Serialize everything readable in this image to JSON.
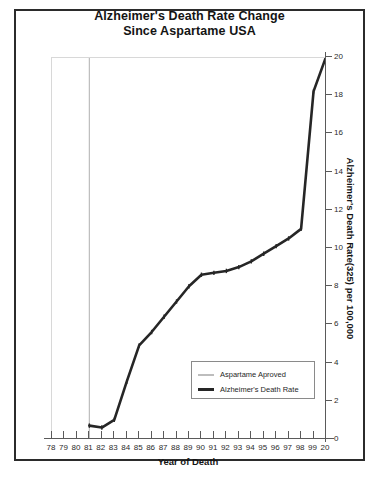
{
  "chart_data": {
    "type": "line",
    "title": "Alzheimer's Death Rate Change Since Aspartame USA",
    "title_line1": "Alzheimer's Death Rate Change",
    "title_line2": "Since Aspartame USA",
    "xlabel": "Year of Death",
    "ylabel": "Alzheimer's Death Rate(325) per 100,000",
    "ylabel_main": "Alzheimer's Death Rate",
    "ylabel_sub": "(325)",
    "ylabel_tail": " per 100,000",
    "xlim": [
      78,
      100
    ],
    "ylim": [
      0,
      20
    ],
    "yticks": [
      0,
      2,
      4,
      6,
      8,
      10,
      12,
      14,
      16,
      18,
      20
    ],
    "ytick_labels": [
      "0",
      "2",
      "4",
      "6",
      "8",
      "10",
      "12",
      "14",
      "16",
      "18",
      "20"
    ],
    "xticks": [
      78,
      79,
      80,
      81,
      82,
      83,
      84,
      85,
      86,
      87,
      88,
      89,
      90,
      91,
      92,
      93,
      94,
      95,
      96,
      97,
      98,
      99,
      100
    ],
    "xtick_labels": [
      "78",
      "79",
      "80",
      "81",
      "82",
      "83",
      "84",
      "85",
      "86",
      "87",
      "88",
      "89",
      "90",
      "91",
      "92",
      "93",
      "94",
      "95",
      "96",
      "97",
      "98",
      "99",
      "20"
    ],
    "grid": false,
    "axis_y_position": "right",
    "legend_position": "inside-lower-right",
    "series": [
      {
        "name": "Aspartame Aproved",
        "color": "#bdbdbd",
        "type": "vline",
        "x": 81
      },
      {
        "name": "Alzheimer's Death Rate",
        "color": "#262626",
        "type": "line",
        "x": [
          81,
          82,
          83,
          84,
          85,
          86,
          87,
          88,
          89,
          90,
          91,
          92,
          93,
          94,
          95,
          96,
          97,
          98,
          99,
          100
        ],
        "values": [
          0.7,
          0.6,
          1.0,
          3.0,
          4.9,
          5.6,
          6.4,
          7.2,
          8.0,
          8.6,
          8.7,
          8.8,
          9.0,
          9.3,
          9.7,
          10.1,
          10.5,
          11.0,
          18.2,
          20.0
        ]
      }
    ]
  },
  "legend": {
    "items": [
      {
        "label": "Aspartame Aproved",
        "swatch": "approved"
      },
      {
        "label": "Alzheimer's Death Rate",
        "swatch": "rate"
      }
    ]
  }
}
